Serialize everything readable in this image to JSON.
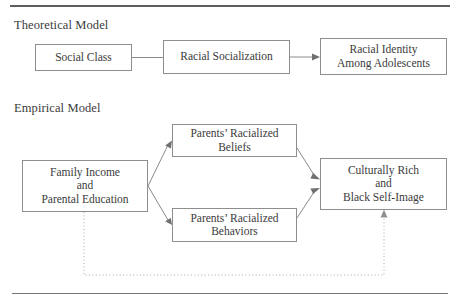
{
  "figure": {
    "sections": [
      {
        "id": "theoretical",
        "heading": "Theoretical Model"
      },
      {
        "id": "empirical",
        "heading": "Empirical Model"
      }
    ],
    "theoretical_model": {
      "nodes": [
        {
          "id": "social-class",
          "label": "Social Class"
        },
        {
          "id": "racial-socialization",
          "label": "Racial Socialization"
        },
        {
          "id": "racial-identity",
          "line1": "Racial Identity",
          "line2": "Among Adolescents"
        }
      ],
      "edges": [
        {
          "from": "social-class",
          "to": "racial-socialization",
          "style": "solid",
          "arrowhead": false
        },
        {
          "from": "racial-socialization",
          "to": "racial-identity",
          "style": "solid",
          "arrowhead": true
        }
      ]
    },
    "empirical_model": {
      "nodes": [
        {
          "id": "family-income",
          "line1": "Family Income",
          "line2": "and",
          "line3": "Parental Education"
        },
        {
          "id": "parents-beliefs",
          "line1": "Parents’ Racialized",
          "line2": "Beliefs"
        },
        {
          "id": "parents-behaviors",
          "line1": "Parents’ Racialized",
          "line2": "Behaviors"
        },
        {
          "id": "culturally-rich",
          "line1": "Culturally Rich",
          "line2": "and",
          "line3": "Black Self-Image"
        }
      ],
      "edges": [
        {
          "from": "family-income",
          "to": "parents-beliefs",
          "style": "solid",
          "arrowhead": true
        },
        {
          "from": "family-income",
          "to": "parents-behaviors",
          "style": "solid",
          "arrowhead": true
        },
        {
          "from": "parents-beliefs",
          "to": "culturally-rich",
          "style": "solid",
          "arrowhead": true
        },
        {
          "from": "parents-behaviors",
          "to": "culturally-rich",
          "style": "solid",
          "arrowhead": true
        },
        {
          "from": "family-income",
          "to": "culturally-rich",
          "style": "dotted",
          "arrowhead": true,
          "routing": "below"
        }
      ]
    },
    "colors": {
      "box_border": "#8e8e8e",
      "text": "#3b3b3b",
      "connector": "#8a8a8a",
      "dotted_connector": "#a9a9a9",
      "rule": "#5d5d5d",
      "background": "#ffffff"
    }
  }
}
